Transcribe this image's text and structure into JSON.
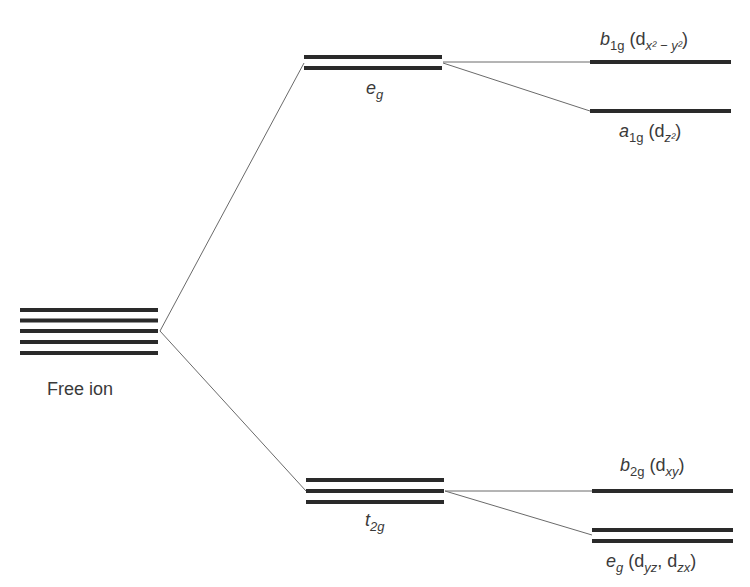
{
  "diagram": {
    "free_ion": {
      "label": "Free ion",
      "levels_count": 5
    },
    "middle": {
      "upper": {
        "symbol": "e",
        "subscript": "g",
        "levels_count": 2
      },
      "lower": {
        "symbol": "t",
        "subscript": "2g",
        "levels_count": 3
      }
    },
    "right": {
      "b1g": {
        "symbol": "b",
        "subscript": "1g",
        "orbital_open": " (d",
        "orbital_sub": "x² − y²",
        "orbital_close": ")"
      },
      "a1g": {
        "symbol": "a",
        "subscript": "1g",
        "orbital_open": " (d",
        "orbital_sub": "z²",
        "orbital_close": ")"
      },
      "b2g": {
        "symbol": "b",
        "subscript": "2g",
        "orbital_open": " (d",
        "orbital_sub": "xy",
        "orbital_close": ")"
      },
      "eg": {
        "symbol": "e",
        "subscript": "g",
        "orbital_open": " (d",
        "orbital_sub": "yz",
        "orbital_mid": ", d",
        "orbital_sub2": "zx",
        "orbital_close": ")"
      }
    },
    "colors": {
      "level_line": "#2a2a2a",
      "connector": "#6a6a6a",
      "text": "#3a3a3a"
    }
  }
}
